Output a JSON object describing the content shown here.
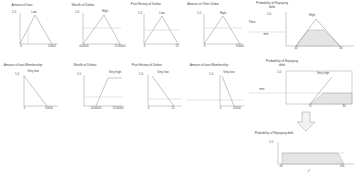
{
  "diagram": {
    "accent_color": "#d9d9d9",
    "line_color": "#7d7d7d",
    "axis_color": "#8d8d8d"
  },
  "panels": [
    {
      "id": "amount-of-loan-high",
      "title": "Amount of loan",
      "y_label": "1.0",
      "term": "Low",
      "ticks": [
        "0",
        "50000"
      ],
      "shape": "triangle"
    },
    {
      "id": "wealth-of-debtor-high",
      "title": "Wealth of Debtor",
      "y_label": "1.0",
      "term": "High",
      "ticks": [
        "400000",
        "1200000"
      ],
      "shape": "triangle"
    },
    {
      "id": "past-history-of-debtor-low",
      "title": "Past History of Debtor",
      "y_label": "1.0",
      "term": "Low",
      "ticks": [
        "0",
        "15"
      ],
      "shape": "triangle"
    },
    {
      "id": "amount-of-other-debts-high",
      "title": "Amount of Other Debts",
      "y_label": "1.0",
      "term": "High",
      "ticks": [
        "0",
        "80000"
      ],
      "shape": "triangle"
    },
    {
      "id": "probability-of-repaying-debt-high",
      "title": "Probability of Repaying debt",
      "y_label": "1.0",
      "term": "High",
      "cut_label": "Then",
      "min_label": "min",
      "ticks": [
        "40",
        "80"
      ],
      "shape": "triangle-clipped"
    },
    {
      "id": "amount-of-loan-membership-very-low",
      "title": "Amount of loan Membership",
      "y_label": "1.0",
      "term": "Very low",
      "ticks": [
        "0",
        "40000"
      ],
      "shape": "descending"
    },
    {
      "id": "wealth-of-debtor-very-high",
      "title": "Wealth of Debtor",
      "y_label": "1.0",
      "term": "Very high",
      "ticks": [
        "1000000",
        "1200000"
      ],
      "shape": "trapezoid"
    },
    {
      "id": "past-history-of-debtor-very-low",
      "title": "Past History of Debtor",
      "y_label": "1.0",
      "term": "Very low",
      "ticks": [
        "0",
        "15"
      ],
      "shape": "descending"
    },
    {
      "id": "amount-of-loan-membership-very-low-2",
      "title": "Amount of loan Membership",
      "y_label": "1.0",
      "term": "Very low",
      "ticks": [
        "0",
        "40000"
      ],
      "shape": "descending"
    },
    {
      "id": "probability-of-repaying-debt-very-high",
      "title": "Probability of Repaying debt",
      "y_label": "1.0",
      "term": "Very high",
      "min_label": "min",
      "ticks": [
        "75",
        "80"
      ],
      "shape": "ramp-clipped"
    },
    {
      "id": "probability-of-repaying-debt-output",
      "title": "Probability of Repaying debt",
      "y_label": "1.0",
      "defuzz_label": "z*",
      "ticks": [
        "40",
        "100"
      ],
      "shape": "aggregated"
    }
  ],
  "connector": {
    "name": "defuzzification-arrow",
    "direction": "down"
  }
}
